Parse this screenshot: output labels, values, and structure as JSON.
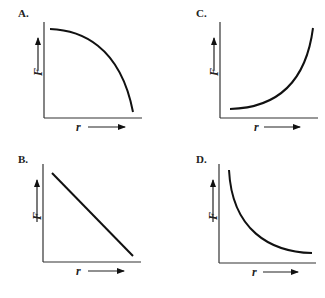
{
  "figure": {
    "x_variable": "r",
    "y_variable": "F",
    "panels": [
      {
        "id": "A",
        "label": "A.",
        "shape": "concave-down decreasing (quarter-circle)",
        "x_label": "r",
        "y_label": "F"
      },
      {
        "id": "B",
        "label": "B.",
        "shape": "linear decreasing",
        "x_label": "r",
        "y_label": "F"
      },
      {
        "id": "C",
        "label": "C.",
        "shape": "concave-up increasing (exponential-like)",
        "x_label": "r",
        "y_label": "F"
      },
      {
        "id": "D",
        "label": "D.",
        "shape": "concave-up decreasing (inverse-square-like)",
        "x_label": "r",
        "y_label": "F"
      }
    ]
  },
  "colors": {
    "ink": "#111111",
    "background": "#ffffff"
  }
}
